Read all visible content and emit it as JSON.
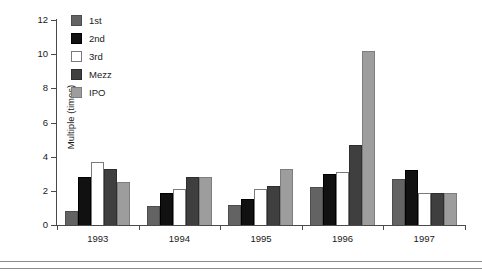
{
  "chart_data": {
    "type": "bar",
    "title": "",
    "xlabel": "",
    "ylabel": "Multiple (times)",
    "categories": [
      "1993",
      "1994",
      "1995",
      "1996",
      "1997"
    ],
    "ylim": [
      0,
      12
    ],
    "ytick_values": [
      0,
      2,
      4,
      6,
      8,
      10,
      12
    ],
    "ytick_labels": [
      "0",
      "2",
      "4",
      "6",
      "8",
      "10",
      "12"
    ],
    "grid": false,
    "legend_position": "top-left-inside",
    "series": [
      {
        "name": "1st",
        "color": "#636363",
        "values": [
          0.8,
          1.1,
          1.2,
          2.2,
          2.7
        ]
      },
      {
        "name": "2nd",
        "color": "#111111",
        "values": [
          2.8,
          1.9,
          1.5,
          3.0,
          3.2
        ]
      },
      {
        "name": "3rd",
        "color": "#ffffff",
        "values": [
          3.7,
          2.1,
          2.1,
          3.1,
          1.9
        ]
      },
      {
        "name": "Mezz",
        "color": "#3f3f3f",
        "values": [
          3.3,
          2.8,
          2.3,
          4.7,
          1.9
        ]
      },
      {
        "name": "IPO",
        "color": "#9d9d9d",
        "values": [
          2.5,
          2.8,
          3.3,
          10.2,
          1.9
        ]
      }
    ]
  }
}
